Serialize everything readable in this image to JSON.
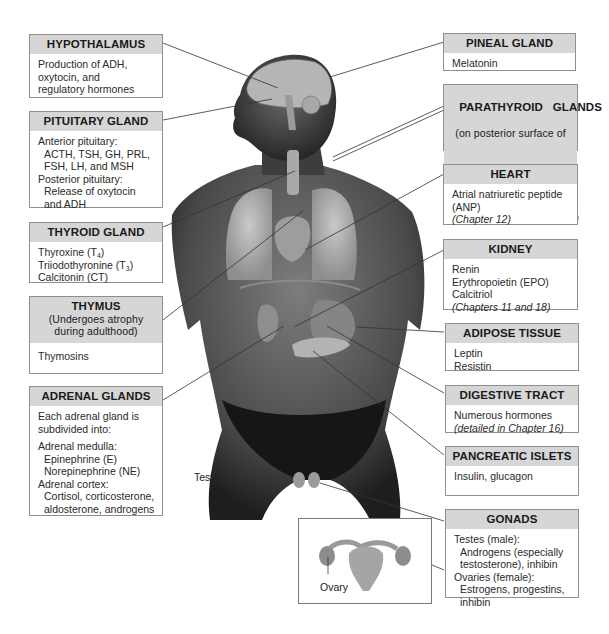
{
  "diagram": {
    "left_boxes": [
      {
        "id": "hypothalamus",
        "title": "HYPOTHALAMUS",
        "lines": [
          "Production of ADH,",
          "oxytocin, and",
          "regulatory hormones"
        ]
      },
      {
        "id": "pituitary",
        "title": "PITUITARY GLAND",
        "lines": [
          "Anterior pituitary:",
          "ACTH, TSH, GH, PRL,",
          "FSH, LH, and MSH",
          "Posterior pituitary:",
          "Release of oxytocin",
          "and ADH"
        ]
      },
      {
        "id": "thyroid",
        "title": "THYROID GLAND",
        "lines": [
          "Thyroxine (T",
          "4",
          ")",
          "Triiodothyronine (T",
          "3",
          ")",
          "Calcitonin (CT)"
        ]
      },
      {
        "id": "thymus",
        "title": "THYMUS",
        "subtitle": [
          "(Undergoes atrophy",
          "during adulthood)"
        ],
        "lines": [
          "Thymosins"
        ]
      },
      {
        "id": "adrenal",
        "title": "ADRENAL GLANDS",
        "lines": [
          "Each adrenal gland is",
          "subdivided into:",
          "Adrenal medulla:",
          "Epinephrine (E)",
          "Norepinephrine (NE)",
          "Adrenal cortex:",
          "Cortisol, corticosterone,",
          "aldosterone, androgens"
        ]
      }
    ],
    "right_boxes": [
      {
        "id": "pineal",
        "title": "PINEAL GLAND",
        "lines": [
          "Melatonin"
        ]
      },
      {
        "id": "parathyroid",
        "title": "PARATHYROID   GLANDS",
        "subtitle": [
          "(on posterior surface of",
          "thyroid gland)"
        ],
        "lines": [
          "Parathyroid hormone (PTH)"
        ]
      },
      {
        "id": "heart",
        "title": "HEART",
        "lines": [
          "Atrial natriuretic peptide",
          "(ANP)",
          "(Chapter 12)"
        ]
      },
      {
        "id": "kidney",
        "title": "KIDNEY",
        "lines": [
          "Renin",
          "Erythropoietin (EPO)",
          "Calcitriol",
          "(Chapters 11 and 18)"
        ]
      },
      {
        "id": "adipose",
        "title": "ADIPOSE TISSUE",
        "lines": [
          "Leptin",
          "Resistin"
        ]
      },
      {
        "id": "digestive",
        "title": "DIGESTIVE TRACT",
        "lines": [
          "Numerous hormones",
          "(detailed in Chapter 16)"
        ]
      },
      {
        "id": "pancreatic",
        "title": "PANCREATIC ISLETS",
        "lines": [
          "Insulin, glucagon"
        ]
      },
      {
        "id": "gonads",
        "title": "GONADS",
        "lines": [
          "Testes (male):",
          "Androgens (especially",
          "testosterone), inhibin",
          "Ovaries (female):",
          "Estrogens, progestins,",
          "inhibin"
        ]
      }
    ],
    "labels": {
      "testis": "Testis",
      "ovary": "Ovary"
    },
    "colors": {
      "header_fill": "#d6d6d6",
      "border": "#8f8f8f",
      "leader_line": "#333333",
      "skin": "#3a3a3a"
    }
  }
}
